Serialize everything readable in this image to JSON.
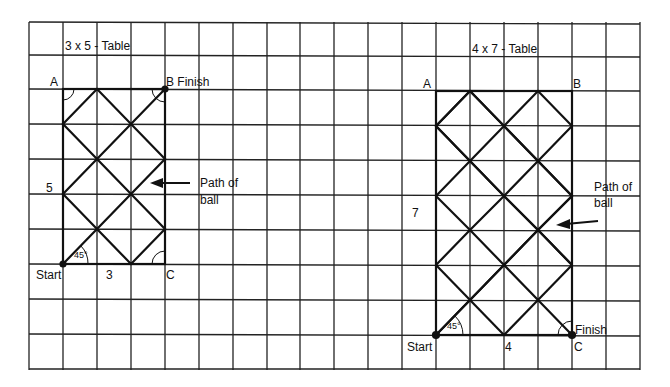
{
  "left_table": {
    "title": "3 x 5 - Table",
    "corner_a": "A",
    "corner_b": "B Finish",
    "corner_c": "C",
    "start": "Start",
    "width_label": "3",
    "height_label": "5",
    "angle": "45°",
    "path_label_1": "Path of",
    "path_label_2": "ball"
  },
  "right_table": {
    "title": "4 x 7 - Table",
    "corner_a": "A",
    "corner_b": "B",
    "corner_c": "C",
    "finish": "Finish",
    "start": "Start",
    "width_label": "4",
    "height_label": "7",
    "angle": "45°",
    "path_label_1": "Path of",
    "path_label_2": "ball"
  },
  "colors": {
    "line": "#1a1a1a",
    "background": "#ffffff"
  }
}
